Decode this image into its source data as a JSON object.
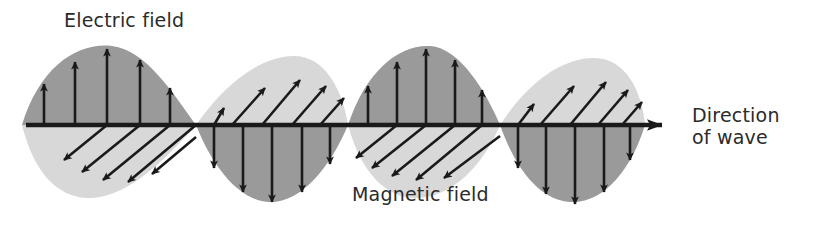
{
  "diagram": {
    "labels": {
      "electric": "Electric field",
      "magnetic": "Magnetic field",
      "direction_line1": "Direction",
      "direction_line2": "of wave"
    },
    "colors": {
      "electric_lobe": "#9a9a9a",
      "magnetic_lobe": "#d8d8d8",
      "axis": "#1a1a1a",
      "arrow": "#1a1a1a",
      "text": "#2b2b2b",
      "background": "#ffffff"
    },
    "axis": {
      "y": 125,
      "x_start": 26,
      "x_end": 676,
      "arrowhead": "right-arrow-icon"
    },
    "wave": {
      "nodes": [
        22,
        196,
        348,
        500,
        645
      ],
      "peak_amplitude": 78,
      "half_waves": [
        {
          "index": 1,
          "electric_side": "above",
          "electric_direction": "up",
          "magnetic_side": "below",
          "magnetic_direction": "down-left"
        },
        {
          "index": 2,
          "electric_side": "below",
          "electric_direction": "down",
          "magnetic_side": "above",
          "magnetic_direction": "up-right"
        },
        {
          "index": 3,
          "electric_side": "above",
          "electric_direction": "up",
          "magnetic_side": "below",
          "magnetic_direction": "down-left"
        },
        {
          "index": 4,
          "electric_side": "below",
          "electric_direction": "down",
          "magnetic_side": "above",
          "magnetic_direction": "up-right"
        }
      ]
    }
  }
}
